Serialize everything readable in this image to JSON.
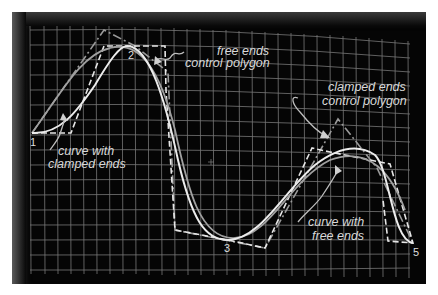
{
  "figure": {
    "background_color": "#050505",
    "grid_color": "#9a9a9a"
  },
  "labels": {
    "free_ends_polygon_line1": "free ends",
    "free_ends_polygon_line2": "control polygon",
    "clamped_ends_polygon_line1": "clamped ends",
    "clamped_ends_polygon_line2": "control polygon",
    "curve_clamped_line1": "curve with",
    "curve_clamped_line2": "clamped ends",
    "curve_free_line1": "curve with",
    "curve_free_line2": "free ends"
  },
  "points": [
    {
      "id": "1",
      "label": "1"
    },
    {
      "id": "2",
      "label": "2"
    },
    {
      "id": "3",
      "label": "3"
    },
    {
      "id": "4",
      "label": "4"
    },
    {
      "id": "5",
      "label": "5"
    }
  ],
  "legend": [
    {
      "name": "free ends control polygon",
      "style": "white dashed"
    },
    {
      "name": "clamped ends control polygon",
      "style": "gray dash-dot"
    },
    {
      "name": "curve with clamped ends",
      "style": "white solid"
    },
    {
      "name": "curve with free ends",
      "style": "gray solid"
    }
  ]
}
